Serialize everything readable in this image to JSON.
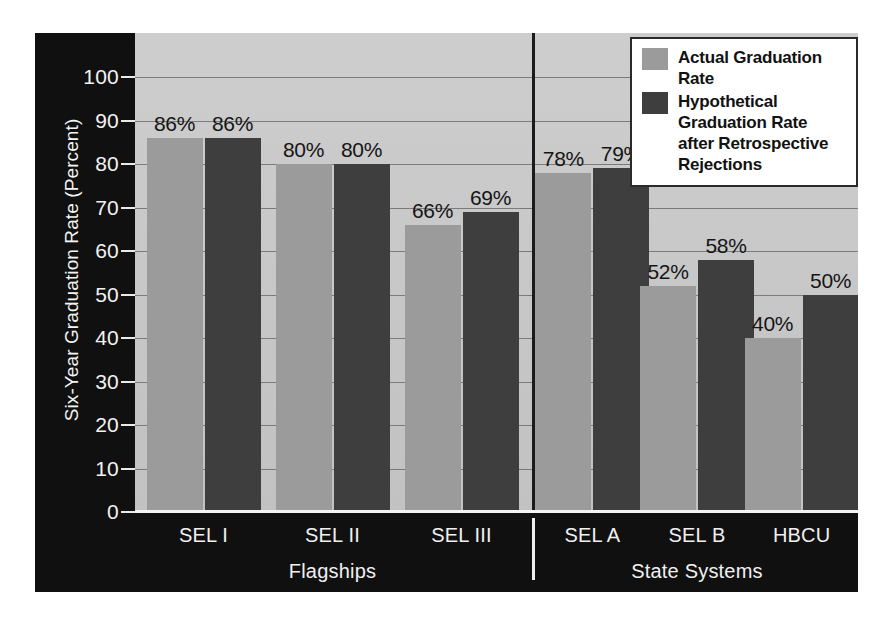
{
  "chart_data": {
    "type": "bar",
    "title": "",
    "xlabel": "",
    "ylabel": "Six-Year Graduation Rate (Percent)",
    "ylim": [
      0,
      100
    ],
    "ytick_step": 10,
    "yticks": [
      "100",
      "90",
      "80",
      "70",
      "60",
      "50",
      "40",
      "30",
      "20",
      "10",
      "0"
    ],
    "grid": true,
    "legend_position": "top-right",
    "categories": [
      "SEL I",
      "SEL II",
      "SEL III",
      "SEL A",
      "SEL B",
      "HBCU"
    ],
    "groups": [
      {
        "label": "Flagships",
        "categories": [
          "SEL I",
          "SEL II",
          "SEL III"
        ]
      },
      {
        "label": "State Systems",
        "categories": [
          "SEL A",
          "SEL B",
          "HBCU"
        ]
      }
    ],
    "series": [
      {
        "name": "Actual Graduation Rate",
        "color": "#9b9b9b",
        "values": [
          86,
          80,
          66,
          78,
          52,
          40
        ],
        "labels": [
          "86%",
          "80%",
          "66%",
          "78%",
          "52%",
          "40%"
        ]
      },
      {
        "name": "Hypothetical Graduation Rate after Retrospective Rejections",
        "color": "#3e3e3e",
        "values": [
          86,
          80,
          69,
          79,
          58,
          50
        ],
        "labels": [
          "86%",
          "80%",
          "69%",
          "79%",
          "58%",
          "50%"
        ]
      }
    ]
  },
  "legend": {
    "entries": [
      {
        "label_line1": "Actual Graduation Rate",
        "label_line2": "",
        "color": "#9b9b9b"
      },
      {
        "label_line1": "Hypothetical Graduation Rate",
        "label_line2": "after Retrospective Rejections",
        "color": "#3e3e3e"
      }
    ]
  },
  "axis": {
    "y_title": "Six-Year Graduation Rate (Percent)"
  },
  "colors": {
    "plot_background": "#c8c8c8",
    "panel_background": "#111010",
    "series_light": "#9b9b9b",
    "series_dark": "#3e3e3e",
    "gridline": "#6d6d6d"
  },
  "caption": ""
}
